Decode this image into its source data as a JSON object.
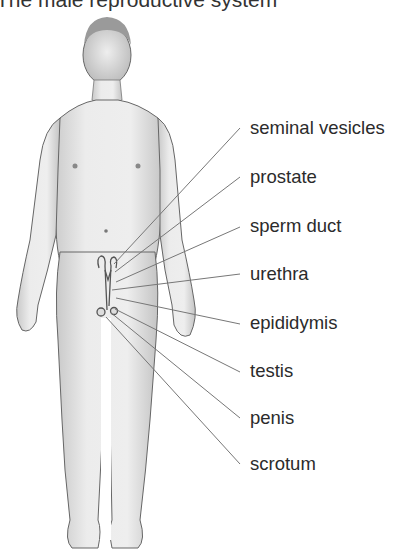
{
  "title": "The male reproductive system",
  "labels": [
    {
      "text": "seminal vesicles",
      "y": 118
    },
    {
      "text": "prostate",
      "y": 167
    },
    {
      "text": "sperm duct",
      "y": 216
    },
    {
      "text": "urethra",
      "y": 264
    },
    {
      "text": "epididymis",
      "y": 313
    },
    {
      "text": "testis",
      "y": 361
    },
    {
      "text": "penis",
      "y": 408
    },
    {
      "text": "scrotum",
      "y": 454
    }
  ],
  "colors": {
    "background": "#ffffff",
    "text": "#2b2b2b",
    "leader_line": "#777777",
    "skin_shade": "#cfcfcf",
    "outline": "#555555"
  }
}
